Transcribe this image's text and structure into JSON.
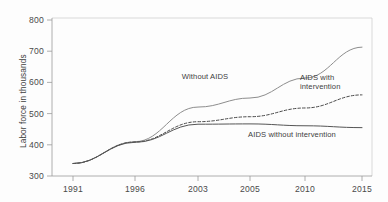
{
  "chart_data": {
    "type": "line",
    "title": "",
    "xlabel": "",
    "ylabel": "Labor force in thousands",
    "ylim": [
      300,
      800
    ],
    "ytick_values": [
      300,
      400,
      500,
      600,
      700,
      800
    ],
    "ytick_labels": [
      "300",
      "400",
      "500",
      "600",
      "700",
      "800"
    ],
    "x": [
      1991,
      1996,
      2003,
      2005,
      2010,
      2015
    ],
    "xtick_labels": [
      "1991",
      "1996",
      "2003",
      "2005",
      "2010",
      "2015"
    ],
    "grid": false,
    "legend_position": "inline-annotations",
    "series": [
      {
        "name": "Without AIDS",
        "label": "Without AIDS",
        "style": "solid-light",
        "color": "#8d8d8d",
        "values": [
          340,
          410,
          521,
          550,
          614,
          713
        ]
      },
      {
        "name": "AIDS with intervention",
        "label": "AIDS with intervention",
        "label_line1": "AIDS with",
        "label_line2": "intervention",
        "style": "dashed",
        "color": "#4a4a4a",
        "values": [
          340,
          409,
          474,
          490,
          518,
          560
        ]
      },
      {
        "name": "AIDS without intervention",
        "label": "AIDS without intervention",
        "style": "solid-dark",
        "color": "#555555",
        "values": [
          340,
          408,
          466,
          467,
          461,
          455
        ]
      }
    ],
    "annotations": [
      {
        "text": "Without AIDS",
        "x": 2003,
        "y": 608
      },
      {
        "text": "AIDS with",
        "x": 2009,
        "y": 608
      },
      {
        "text": "intervention",
        "x": 2009,
        "y": 583
      },
      {
        "text": "AIDS without intervention",
        "x": 2008,
        "y": 420
      }
    ]
  }
}
